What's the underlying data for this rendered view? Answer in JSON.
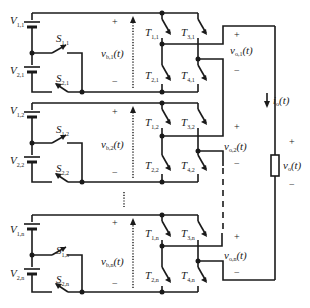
{
  "diagram": {
    "type": "cascaded H-bridge multilevel inverter with dual-source cells",
    "cells": [
      {
        "id": "1",
        "sources": [
          {
            "label": "V",
            "sub": "1,1"
          },
          {
            "label": "V",
            "sub": "2,1"
          }
        ],
        "switches": [
          {
            "label": "S",
            "sub": "1,1"
          },
          {
            "label": "S",
            "sub": "2,1"
          }
        ],
        "transistors": [
          {
            "label": "T",
            "sub": "1,1"
          },
          {
            "label": "T",
            "sub": "2,1"
          },
          {
            "label": "T",
            "sub": "3,1"
          },
          {
            "label": "T",
            "sub": "4,1"
          }
        ],
        "bus_voltage": {
          "label": "v",
          "sub": "b,1",
          "suffix": "(t)"
        },
        "output_voltage": {
          "label": "v",
          "sub": "o,1",
          "suffix": "(t)"
        }
      },
      {
        "id": "2",
        "sources": [
          {
            "label": "V",
            "sub": "1,2"
          },
          {
            "label": "V",
            "sub": "2,2"
          }
        ],
        "switches": [
          {
            "label": "S",
            "sub": "1,2"
          },
          {
            "label": "S",
            "sub": "2,2"
          }
        ],
        "transistors": [
          {
            "label": "T",
            "sub": "1,2"
          },
          {
            "label": "T",
            "sub": "2,2"
          },
          {
            "label": "T",
            "sub": "3,2"
          },
          {
            "label": "T",
            "sub": "4,2"
          }
        ],
        "bus_voltage": {
          "label": "v",
          "sub": "b,2",
          "suffix": "(t)"
        },
        "output_voltage": {
          "label": "v",
          "sub": "o,2",
          "suffix": "(t)"
        }
      },
      {
        "id": "n",
        "sources": [
          {
            "label": "V",
            "sub": "1,n"
          },
          {
            "label": "V",
            "sub": "2,n"
          }
        ],
        "switches": [
          {
            "label": "S",
            "sub": "1,n"
          },
          {
            "label": "S",
            "sub": "2,n"
          }
        ],
        "transistors": [
          {
            "label": "T",
            "sub": "1,n"
          },
          {
            "label": "T",
            "sub": "2,n"
          },
          {
            "label": "T",
            "sub": "3,n"
          },
          {
            "label": "T",
            "sub": "4,n"
          }
        ],
        "bus_voltage": {
          "label": "v",
          "sub": "b,n",
          "suffix": "(t)"
        },
        "output_voltage": {
          "label": "v",
          "sub": "o,n",
          "suffix": "(t)"
        }
      }
    ],
    "load": {
      "current": {
        "label": "i",
        "sub": "o",
        "suffix": "(t)"
      },
      "voltage": {
        "label": "v",
        "sub": "o",
        "suffix": "(t)"
      }
    },
    "signs": {
      "plus": "+",
      "minus": "−"
    }
  }
}
